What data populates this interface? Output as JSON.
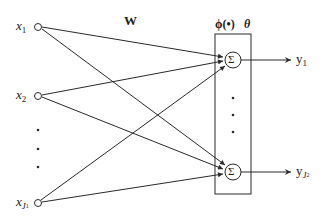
{
  "diagram": {
    "type": "single-layer neural network",
    "weight_label": "W",
    "activation_label": "ϕ(•)",
    "threshold_label": "θ",
    "summation_symbol": "Σ",
    "inputs": [
      {
        "var": "x",
        "sub": "1",
        "subsub": ""
      },
      {
        "var": "x",
        "sub": "2",
        "subsub": ""
      },
      {
        "var": "x",
        "sub": "J",
        "subsub": "1"
      }
    ],
    "outputs": [
      {
        "var": "y",
        "sub": "1",
        "subsub": ""
      },
      {
        "var": "y",
        "sub": "J",
        "subsub": "2"
      }
    ],
    "colors": {
      "line": "#2a2a2a",
      "background": "#ffffff"
    }
  }
}
